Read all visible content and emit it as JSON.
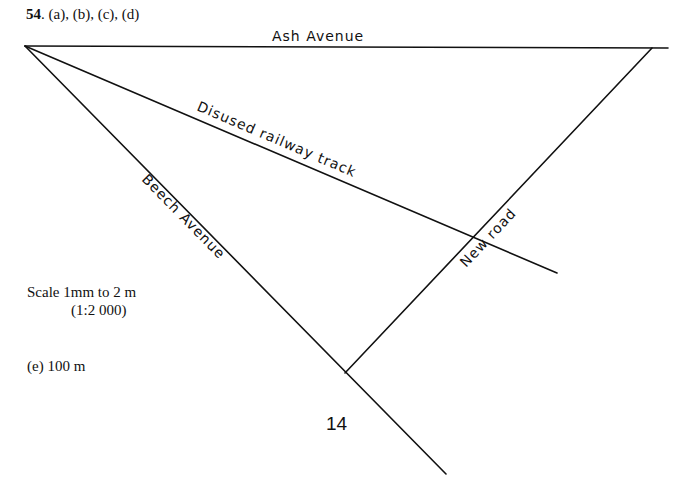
{
  "heading": {
    "number": "54",
    "parts": ". (a), (b), (c), (d)"
  },
  "diagram": {
    "labels": {
      "ash_avenue": "Ash Avenue",
      "disused_railway": "Disused railway track",
      "beech_avenue": "Beech Avenue",
      "new_road": "New road"
    },
    "line_color": "#111111"
  },
  "scale": {
    "line1": "Scale 1mm to 2 m",
    "line2": "(1:2 000)"
  },
  "answer_e": "(e) 100 m",
  "page_number": "14"
}
